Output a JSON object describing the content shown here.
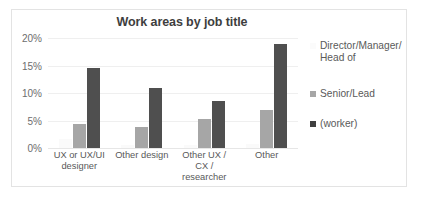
{
  "chart_data": {
    "type": "bar",
    "title": "Work areas by job title",
    "xlabel": "",
    "ylabel": "",
    "ylim": [
      0,
      20
    ],
    "yticks": [
      "0%",
      "5%",
      "10%",
      "15%",
      "20%"
    ],
    "ytick_values": [
      0,
      5,
      10,
      15,
      20
    ],
    "grid": true,
    "legend_position": "right",
    "categories": [
      "UX or UX/UI designer",
      "Other design",
      "Other UX / CX / researcher",
      "Other"
    ],
    "category_lines": [
      [
        "UX or UX/UI",
        "designer"
      ],
      [
        "Other design"
      ],
      [
        "Other UX /",
        "CX /",
        "researcher"
      ],
      [
        "Other"
      ]
    ],
    "series": [
      {
        "name": "Director/Manager/\nHead of",
        "color": "#fafafa",
        "values": [
          1.6,
          0.5,
          0.6,
          0.8
        ]
      },
      {
        "name": "Senior/Lead",
        "color": "#a6a6a6",
        "values": [
          4.4,
          3.8,
          5.3,
          7.0
        ]
      },
      {
        "name": "(worker)",
        "color": "#4f4f4f",
        "values": [
          14.5,
          11.0,
          8.6,
          18.9
        ]
      }
    ]
  },
  "legend": {
    "entries": [
      "Director/Manager/\nHead of",
      "Senior/Lead",
      "(worker)"
    ]
  }
}
